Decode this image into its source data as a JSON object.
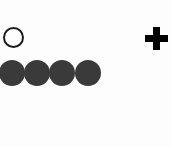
{
  "figure": {
    "width": 172,
    "height": 147,
    "background_color": "#fdfdfd",
    "caption": "",
    "description": "One hollow circle above a row of four filled circles, with a thick plus marker at the right"
  },
  "chart_data": {
    "type": "scatter",
    "title": "",
    "subtitle": "",
    "xlabel": "",
    "ylabel": "",
    "xlim": [
      0,
      172
    ],
    "ylim": [
      0,
      147
    ],
    "grid": false,
    "legend_position": "none",
    "tick_labels": {
      "x": [],
      "y": []
    },
    "annotations": [],
    "series": [
      {
        "name": "open-circle",
        "marker": "circle-open",
        "marker_size_px": 21,
        "edge_color": "#1c1c1c",
        "edge_width_px": 2,
        "fill_color": "none",
        "points": [
          {
            "x": 13,
            "y": 37
          }
        ]
      },
      {
        "name": "filled-circles",
        "marker": "circle-filled",
        "marker_size_px": 26,
        "edge_color": "#2b2b2b",
        "edge_width_px": 1,
        "fill_color": "#3a3a3a",
        "points": [
          {
            "x": 12,
            "y": 73
          },
          {
            "x": 37,
            "y": 73
          },
          {
            "x": 62,
            "y": 73
          },
          {
            "x": 88,
            "y": 73
          }
        ]
      },
      {
        "name": "plus-marker",
        "marker": "plus",
        "marker_size_px": 23,
        "edge_color": "#000000",
        "edge_width_px": 7,
        "fill_color": "#000000",
        "points": [
          {
            "x": 156,
            "y": 38
          }
        ]
      }
    ]
  },
  "markers": {
    "open_circle": {
      "label": "open circle marker",
      "center_x": 13,
      "center_y": 37,
      "diameter": 21,
      "stroke_width": 2,
      "stroke_color": "#1c1c1c",
      "fill_color": "#fefefe"
    },
    "filled_circles": [
      {
        "label": "filled circle 1",
        "center_x": 12,
        "center_y": 73,
        "diameter": 26,
        "fill_color": "#3a3a3a"
      },
      {
        "label": "filled circle 2",
        "center_x": 37,
        "center_y": 73,
        "diameter": 26,
        "fill_color": "#3a3a3a"
      },
      {
        "label": "filled circle 3",
        "center_x": 62,
        "center_y": 73,
        "diameter": 26,
        "fill_color": "#3a3a3a"
      },
      {
        "label": "filled circle 4",
        "center_x": 88,
        "center_y": 73,
        "diameter": 26,
        "fill_color": "#3a3a3a"
      }
    ],
    "plus": {
      "label": "plus marker",
      "center_x": 156,
      "center_y": 38,
      "span": 23,
      "arm_thickness": 7,
      "color": "#000000"
    }
  }
}
